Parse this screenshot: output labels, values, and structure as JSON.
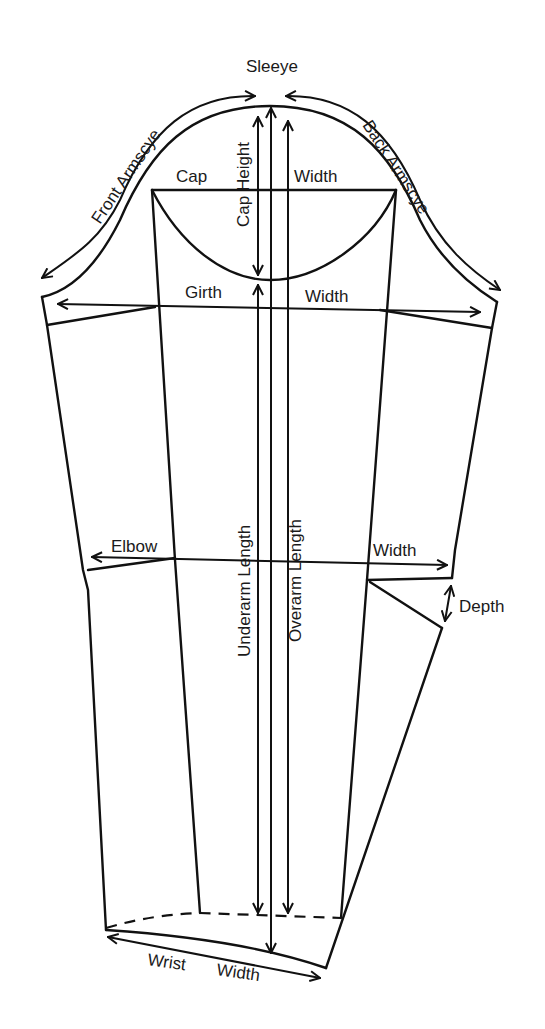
{
  "title": "Sleeye",
  "labels": {
    "front_armscye": "Front Armscye",
    "back_armscye": "Back Armscye",
    "cap": "Cap",
    "cap_width": "Width",
    "cap_height": "Cap Height",
    "girth": "Girth",
    "girth_width": "Width",
    "elbow": "Elbow",
    "elbow_width": "Width",
    "underarm_length": "Underarm Length",
    "overarm_length": "Overarm Length",
    "depth": "Depth",
    "wrist": "Wrist",
    "wrist_width": "Width"
  },
  "colors": {
    "line": "#111111",
    "background": "#ffffff"
  }
}
